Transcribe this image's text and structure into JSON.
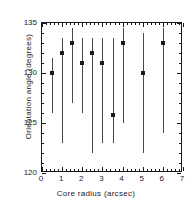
{
  "chart_data": {
    "type": "scatter",
    "title": "",
    "xlabel": "Core radius (arcsec)",
    "ylabel": "Orientation angle (degrees)",
    "xlim": [
      0,
      7
    ],
    "ylim": [
      120,
      135
    ],
    "xticks": [
      0,
      1,
      2,
      3,
      4,
      5,
      6,
      7
    ],
    "xtick_labels": [
      "0",
      "1",
      "2",
      "3",
      "4",
      "5",
      "6",
      "7"
    ],
    "yticks": [
      120,
      125,
      130,
      135
    ],
    "ytick_labels": [
      "120",
      "125",
      "130",
      "135"
    ],
    "x_minor_per_major": 5,
    "y_minor_per_major": 5,
    "grid": false,
    "legend": null,
    "marker_style": "filled-square",
    "error_bar_style": "vertical-line-no-caps",
    "series": [
      {
        "name": "Orientation angle vs core radius",
        "points": [
          {
            "x": 0.5,
            "y": 130.0,
            "ylow": 126.0,
            "yhigh": 131.5
          },
          {
            "x": 1.0,
            "y": 132.0,
            "ylow": 123.0,
            "yhigh": 133.5
          },
          {
            "x": 1.5,
            "y": 133.0,
            "ylow": 127.0,
            "yhigh": 134.5
          },
          {
            "x": 2.0,
            "y": 131.0,
            "ylow": 126.0,
            "yhigh": 133.5
          },
          {
            "x": 2.5,
            "y": 132.0,
            "ylow": 122.0,
            "yhigh": 133.5
          },
          {
            "x": 3.0,
            "y": 131.0,
            "ylow": 123.0,
            "yhigh": 133.5
          },
          {
            "x": 3.5,
            "y": 125.8,
            "ylow": 123.0,
            "yhigh": 133.5
          },
          {
            "x": 4.0,
            "y": 133.0,
            "ylow": 125.0,
            "yhigh": 134.5
          },
          {
            "x": 5.0,
            "y": 130.0,
            "ylow": 122.0,
            "yhigh": 134.0
          },
          {
            "x": 6.0,
            "y": 133.0,
            "ylow": 124.0,
            "yhigh": 134.5
          }
        ]
      }
    ],
    "colors": {
      "axis": "#1a1a1a",
      "marker": "#1a1a1a",
      "error_bar": "#4a4a4a",
      "background": "#ffffff"
    }
  }
}
